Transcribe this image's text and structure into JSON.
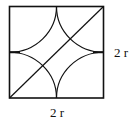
{
  "diagram": {
    "title": "",
    "labels": {
      "right": "2 r",
      "bottom": "2 r"
    },
    "shape": {
      "type": "square with four inscribed quarter-circle arcs (astroid-like) and one diagonal",
      "square": {
        "x0": 9,
        "y0": 6,
        "x1": 104,
        "y1": 98
      },
      "diagonal": "bottom-left to top-right",
      "arcs": "four circular arcs centered at the square's corners, radius r, meeting at edge midpoints"
    },
    "colors": {
      "stroke": "#111111",
      "background": "#ffffff"
    }
  }
}
